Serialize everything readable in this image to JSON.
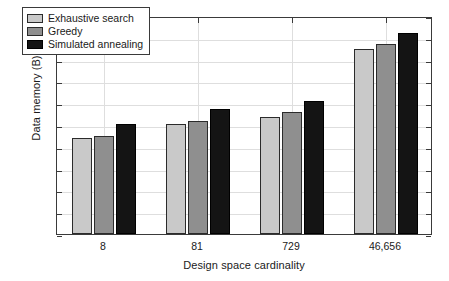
{
  "chart_data": {
    "type": "bar",
    "title": "",
    "xlabel": "Design space cardinality",
    "ylabel": "Data memory (B)",
    "categories": [
      "8",
      "81",
      "729",
      "46,656"
    ],
    "series": [
      {
        "name": "Exhaustive search",
        "color": "#c9c9c9",
        "values": [
          440,
          503,
          535,
          850
        ]
      },
      {
        "name": "Greedy",
        "color": "#8f8f8f",
        "values": [
          450,
          518,
          560,
          873
        ]
      },
      {
        "name": "Simulated annealing",
        "color": "#141414",
        "values": [
          505,
          573,
          612,
          922
        ]
      }
    ],
    "ylim": [
      0,
      1000
    ],
    "yticks": [
      0,
      100,
      200,
      300,
      400,
      500,
      600,
      700,
      800,
      900,
      1000
    ],
    "ytick_labels": [
      "0",
      "100",
      "200",
      "300",
      "400",
      "500",
      "600",
      "700",
      "800",
      "900",
      "1000"
    ],
    "grid": true,
    "legend_position": "upper left"
  }
}
